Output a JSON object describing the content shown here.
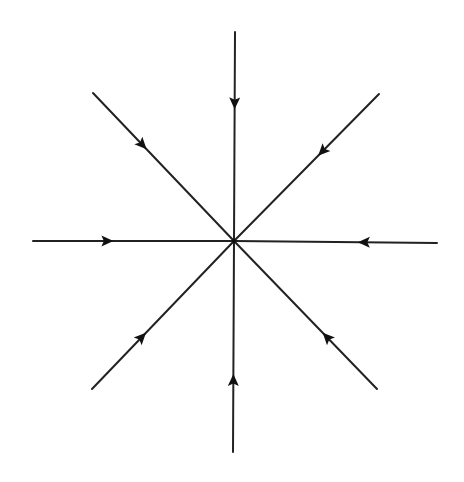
{
  "diagram": {
    "type": "phase-portrait",
    "center": {
      "x": 234,
      "y": 241
    },
    "line_color": "#222222",
    "arrow_color": "#111111",
    "background": "#ffffff",
    "arrow_direction": "inward",
    "rays": [
      {
        "name": "north",
        "x1": 235,
        "y1": 32,
        "arrow_t": 0.37
      },
      {
        "name": "north-east",
        "x1": 379,
        "y1": 94,
        "arrow_t": 0.42
      },
      {
        "name": "east",
        "x1": 437,
        "y1": 243,
        "arrow_t": 0.39
      },
      {
        "name": "south-east",
        "x1": 377,
        "y1": 389,
        "arrow_t": 0.38
      },
      {
        "name": "south",
        "x1": 233,
        "y1": 452,
        "arrow_t": 0.37
      },
      {
        "name": "south-west",
        "x1": 92,
        "y1": 389,
        "arrow_t": 0.38
      },
      {
        "name": "west",
        "x1": 33,
        "y1": 241,
        "arrow_t": 0.4
      },
      {
        "name": "north-west",
        "x1": 93,
        "y1": 93,
        "arrow_t": 0.38
      }
    ]
  }
}
